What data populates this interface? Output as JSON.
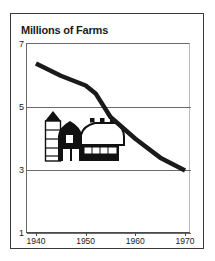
{
  "figure": {
    "title": "Millions of Farms",
    "frame_color": "#3a3a3a",
    "line_color": "#1a1a1a",
    "grid_color": "#6a6a6a",
    "background": "#ffffff"
  },
  "illustration": {
    "name": "farm-barn-and-silo",
    "description": "Black barn with curved gambrel roof, three roof vents, white windows, and a banded silo with dark conical cap"
  },
  "chart_data": {
    "type": "line",
    "title": "Millions of Farms",
    "xlabel": "",
    "ylabel": "Millions of Farms",
    "xlim": [
      1938,
      1971
    ],
    "ylim": [
      1,
      7
    ],
    "xticks": [
      1940,
      1950,
      1960,
      1970
    ],
    "xtick_labels": [
      "1940",
      "1950",
      "1960",
      "1970"
    ],
    "yticks": [
      1,
      3,
      5,
      7
    ],
    "ytick_labels": [
      "1",
      "3",
      "5",
      "7"
    ],
    "grid": true,
    "legend": "none",
    "series": [
      {
        "name": "Number of farms",
        "units": "millions",
        "x": [
          1940,
          1945,
          1950,
          1952,
          1955,
          1960,
          1965,
          1970
        ],
        "values": [
          6.35,
          5.96,
          5.65,
          5.4,
          4.65,
          3.96,
          3.36,
          2.95
        ]
      }
    ]
  }
}
